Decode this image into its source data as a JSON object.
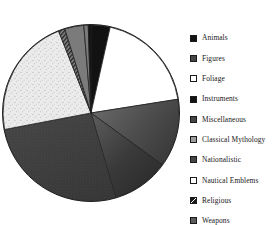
{
  "chart_data": {
    "type": "pie",
    "title": "",
    "subtitle": "",
    "xlabel": "",
    "ylabel": "",
    "grid": false,
    "legend_position": "right",
    "start_angle_deg": 0,
    "direction": "clockwise",
    "categories": [
      "Animals",
      "Figures",
      "Foliage",
      "Instruments",
      "Miscellaneous",
      "Classical Mythology",
      "Nationalistic",
      "Nautical Emblems",
      "Religious",
      "Weapons"
    ],
    "values": [
      3.5,
      19.0,
      12.5,
      10.5,
      26.5,
      22.0,
      1.2,
      3.5,
      0.8,
      0.5
    ],
    "units": "percent",
    "slices": [
      {
        "label": "Animals",
        "value": 3.5,
        "start_deg": 0.0,
        "end_deg": 12.6,
        "fill": "solid-black",
        "color": "#111111"
      },
      {
        "label": "Figures",
        "value": 19.0,
        "start_deg": 12.6,
        "end_deg": 81.0,
        "fill": "solid-white",
        "color": "#ffffff"
      },
      {
        "label": "Foliage",
        "value": 12.5,
        "start_deg": 81.0,
        "end_deg": 126.0,
        "fill": "gradient-dark",
        "color": "#4a4a4a"
      },
      {
        "label": "Instruments",
        "value": 10.5,
        "start_deg": 126.0,
        "end_deg": 163.8,
        "fill": "gradient-darker",
        "color": "#3a3a3a"
      },
      {
        "label": "Miscellaneous",
        "value": 26.5,
        "start_deg": 163.8,
        "end_deg": 259.2,
        "fill": "texture-dark",
        "color": "#404040"
      },
      {
        "label": "Classical Mythology",
        "value": 22.0,
        "start_deg": 259.2,
        "end_deg": 338.4,
        "fill": "speckle-light",
        "color": "#e0e0e0"
      },
      {
        "label": "Nationalistic",
        "value": 1.2,
        "start_deg": 338.4,
        "end_deg": 342.7,
        "fill": "hatch-dark",
        "color": "#2f2f2f"
      },
      {
        "label": "Nautical Emblems",
        "value": 3.5,
        "start_deg": 342.7,
        "end_deg": 355.3,
        "fill": "solid-midgray",
        "color": "#7a7a7a"
      },
      {
        "label": "Religious",
        "value": 0.8,
        "start_deg": 355.3,
        "end_deg": 358.2,
        "fill": "solid-midgray",
        "color": "#8a8a8a"
      },
      {
        "label": "Weapons",
        "value": 0.5,
        "start_deg": 358.2,
        "end_deg": 360.0,
        "fill": "solid-black",
        "color": "#1d1d1d"
      }
    ]
  },
  "legend": {
    "items": [
      {
        "label": "Animals",
        "swatch": "solid-black",
        "swatch_color": "#141414"
      },
      {
        "label": "Figures",
        "swatch": "solid-darkgray",
        "swatch_color": "#4b4b4b"
      },
      {
        "label": "Foliage",
        "swatch": "solid-white",
        "swatch_color": "#ffffff"
      },
      {
        "label": "Instruments",
        "swatch": "solid-black",
        "swatch_color": "#141414"
      },
      {
        "label": "Miscellaneous",
        "swatch": "solid-darkgray",
        "swatch_color": "#434343"
      },
      {
        "label": "Classical Mythology",
        "swatch": "solid-lightgray",
        "swatch_color": "#9d9d9d"
      },
      {
        "label": "Nationalistic",
        "swatch": "solid-darkgray",
        "swatch_color": "#3b3b3b"
      },
      {
        "label": "Nautical Emblems",
        "swatch": "solid-white",
        "swatch_color": "#fdfdfd"
      },
      {
        "label": "Religious",
        "swatch": "checked-dark",
        "swatch_color": "#262626"
      },
      {
        "label": "Weapons",
        "swatch": "solid-midgray",
        "swatch_color": "#5c5c5c"
      }
    ]
  },
  "colors": {
    "outline": "#1a1a1a",
    "text": "#171717",
    "background": "#ffffff"
  }
}
